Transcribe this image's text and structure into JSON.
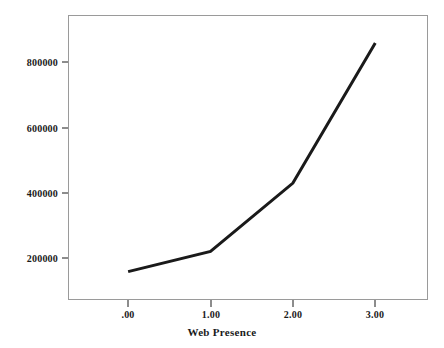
{
  "chart_data": {
    "type": "line",
    "title": "",
    "xlabel": "Web Presence",
    "ylabel": "Mean Total Votes Received",
    "x": [
      0,
      1,
      2,
      3
    ],
    "values": [
      143000,
      205000,
      414000,
      843000
    ],
    "xtick_labels": [
      ".00",
      "1.00",
      "2.00",
      "3.00"
    ],
    "ytick_labels": [
      "200000",
      "400000",
      "600000",
      "800000"
    ],
    "ytick_values": [
      200000,
      400000,
      600000,
      800000
    ],
    "xlim": [
      -0.73,
      3.64
    ],
    "ylim": [
      56000,
      929000
    ],
    "grid": false,
    "legend": "none",
    "line_color": "#1a1a1a",
    "frame_color": "#9a9a9a",
    "background_color": "#ffffff"
  },
  "axes": {
    "y_tick_0": "200000",
    "y_tick_1": "400000",
    "y_tick_2": "600000",
    "y_tick_3": "800000",
    "x_tick_0": ".00",
    "x_tick_1": "1.00",
    "x_tick_2": "2.00",
    "x_tick_3": "3.00",
    "x_title": "Web Presence",
    "y_title": "Mean Total Votes Received"
  }
}
